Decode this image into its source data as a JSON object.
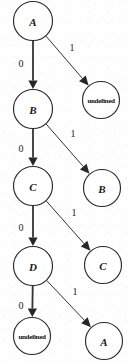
{
  "diagram": {
    "type": "state-transition-tree",
    "background_color": "#fefefe",
    "stroke_color": "#333333",
    "text_color": "#1a1a1a",
    "nodes": [
      {
        "id": "n0",
        "label": "A",
        "kind": "state",
        "cx": 33,
        "cy": 21,
        "r": 19.5
      },
      {
        "id": "n1",
        "label": "undefined",
        "kind": "terminal",
        "cx": 101,
        "cy": 100,
        "r": 18.5
      },
      {
        "id": "n2",
        "label": "B",
        "kind": "state",
        "cx": 33,
        "cy": 109,
        "r": 19.5
      },
      {
        "id": "n3",
        "label": "B",
        "kind": "state",
        "cx": 102,
        "cy": 188,
        "r": 18.5
      },
      {
        "id": "n4",
        "label": "C",
        "kind": "state",
        "cx": 33,
        "cy": 186,
        "r": 19.5
      },
      {
        "id": "n5",
        "label": "C",
        "kind": "state",
        "cx": 103,
        "cy": 265,
        "r": 18.5
      },
      {
        "id": "n6",
        "label": "D",
        "kind": "state",
        "cx": 33,
        "cy": 266,
        "r": 19.5
      },
      {
        "id": "n7",
        "label": "undefined",
        "kind": "terminal",
        "cx": 32,
        "cy": 336,
        "r": 18.5
      },
      {
        "id": "n8",
        "label": "A",
        "kind": "state",
        "cx": 104,
        "cy": 341,
        "r": 18.5
      }
    ],
    "edges": [
      {
        "id": "e0",
        "from": "n0",
        "to": "n2",
        "label": "0",
        "weight": "thick",
        "label_x": 21,
        "label_y": 63
      },
      {
        "id": "e1",
        "from": "n0",
        "to": "n1",
        "label": "1",
        "weight": "thin",
        "label_x": 72,
        "label_y": 47
      },
      {
        "id": "e2",
        "from": "n2",
        "to": "n4",
        "label": "0",
        "weight": "thick",
        "label_x": 21,
        "label_y": 148
      },
      {
        "id": "e3",
        "from": "n2",
        "to": "n3",
        "label": "1",
        "weight": "thin",
        "label_x": 73,
        "label_y": 133
      },
      {
        "id": "e4",
        "from": "n4",
        "to": "n6",
        "label": "0",
        "weight": "thick",
        "label_x": 21,
        "label_y": 227
      },
      {
        "id": "e5",
        "from": "n4",
        "to": "n5",
        "label": "1",
        "weight": "thin",
        "label_x": 74,
        "label_y": 212
      },
      {
        "id": "e6",
        "from": "n6",
        "to": "n7",
        "label": "0",
        "weight": "thick",
        "label_x": 21,
        "label_y": 305
      },
      {
        "id": "e7",
        "from": "n6",
        "to": "n8",
        "label": "1",
        "weight": "thin",
        "label_x": 75,
        "label_y": 291
      }
    ],
    "edge_label_values": {
      "zero": "0",
      "one": "1"
    }
  }
}
